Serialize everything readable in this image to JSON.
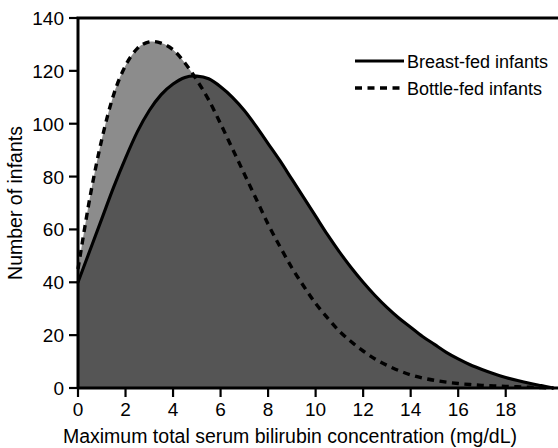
{
  "chart_data": {
    "type": "area",
    "title": "",
    "xlabel": "Maximum total serum bilirubin concentration (mg/dL)",
    "ylabel": "Number of infants",
    "xlim": [
      0,
      20.2
    ],
    "ylim": [
      0,
      140
    ],
    "xticks": [
      0,
      2,
      4,
      6,
      8,
      10,
      12,
      14,
      16,
      18
    ],
    "yticks": [
      0,
      20,
      40,
      60,
      80,
      100,
      120,
      140
    ],
    "grid": false,
    "legend_position": "top-right",
    "colors": {
      "curve": "#000000",
      "fill_breast_only": "#555555",
      "fill_bottle_upper": "#8c8c8c",
      "axis": "#000000",
      "background": "#ffffff"
    },
    "x": [
      0,
      0.5,
      1,
      1.5,
      2,
      2.5,
      3,
      3.5,
      4,
      4.5,
      5,
      5.5,
      6,
      6.5,
      7,
      7.5,
      8,
      8.5,
      9,
      9.5,
      10,
      10.5,
      11,
      11.5,
      12,
      12.5,
      13,
      13.5,
      14,
      14.5,
      15,
      15.5,
      16,
      16.5,
      17,
      17.5,
      18,
      18.5,
      19,
      19.5,
      20
    ],
    "series": [
      {
        "name": "Breast-fed infants",
        "style": "solid",
        "values": [
          40,
          52,
          64,
          76,
          87,
          97,
          105,
          111,
          115,
          117.5,
          118,
          117,
          114,
          110,
          105,
          99,
          92.5,
          86,
          79,
          72,
          65,
          58,
          51.5,
          45.5,
          40,
          35,
          30.5,
          26.5,
          23,
          19.5,
          16.5,
          13.5,
          11,
          8.8,
          7,
          5.4,
          4,
          2.8,
          1.8,
          0.9,
          0
        ]
      },
      {
        "name": "Bottle-fed infants",
        "style": "dashed",
        "values": [
          45,
          72,
          94,
          111,
          122,
          128.5,
          131,
          130.5,
          128,
          123,
          116.5,
          109,
          100,
          90.5,
          81,
          71.5,
          62,
          53.5,
          45.5,
          38.5,
          32,
          26.5,
          21.5,
          17.5,
          14,
          11,
          8.6,
          6.6,
          5,
          3.8,
          2.9,
          2.2,
          1.7,
          1.3,
          1,
          0.8,
          0.6,
          0.45,
          0.3,
          0.15,
          0
        ]
      }
    ]
  },
  "legend": {
    "items": [
      {
        "label": "Breast-fed infants",
        "style": "solid"
      },
      {
        "label": "Bottle-fed infants",
        "style": "dashed"
      }
    ]
  },
  "axes": {
    "x_title": "Maximum total serum bilirubin concentration (mg/dL)",
    "y_title": "Number of infants",
    "x_tick_labels": [
      "0",
      "2",
      "4",
      "6",
      "8",
      "10",
      "12",
      "14",
      "16",
      "18"
    ],
    "y_tick_labels": [
      "0",
      "20",
      "40",
      "60",
      "80",
      "100",
      "120",
      "140"
    ]
  }
}
